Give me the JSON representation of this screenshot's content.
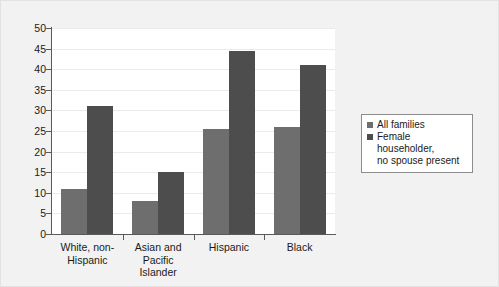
{
  "chart_data": {
    "type": "bar",
    "title": "",
    "subtitle": "",
    "xlabel": "",
    "ylabel": "",
    "ylim": [
      0,
      50
    ],
    "ytick_step": 5,
    "yticks": [
      "0",
      "5",
      "10",
      "15",
      "20",
      "25",
      "30",
      "35",
      "40",
      "45",
      "50"
    ],
    "grid": true,
    "legend_position": "right",
    "categories": [
      "White, non-\nHispanic",
      "Asian and Pacific\nIslander",
      "Hispanic",
      "Black"
    ],
    "series": [
      {
        "name": "All families",
        "color": "#6e6e6e",
        "values": [
          11,
          8,
          25.5,
          26
        ]
      },
      {
        "name": "Female householder,\nno spouse present",
        "color": "#4d4d4d",
        "values": [
          31,
          15,
          44.5,
          41
        ]
      }
    ]
  },
  "legend": {
    "items": [
      {
        "label": "All families",
        "color": "#6e6e6e"
      },
      {
        "label": "Female householder,\nno spouse present",
        "color": "#4d4d4d"
      }
    ]
  },
  "axes": {
    "y_tick_labels": [
      "50",
      "45",
      "40",
      "35",
      "30",
      "25",
      "20",
      "15",
      "10",
      "5",
      "0"
    ],
    "x_tick_labels": [
      "White, non-\nHispanic",
      "Asian and Pacific\nIslander",
      "Hispanic",
      "Black"
    ]
  },
  "colors": {
    "figure_background": "#f2f2f2",
    "plot_background": "#ffffff",
    "axis": "#5a5a5a",
    "gridline": "#ebebeb",
    "series_1": "#6e6e6e",
    "series_2": "#4d4d4d",
    "legend_border": "#8c8c8c",
    "text": "#1a1a1a"
  }
}
